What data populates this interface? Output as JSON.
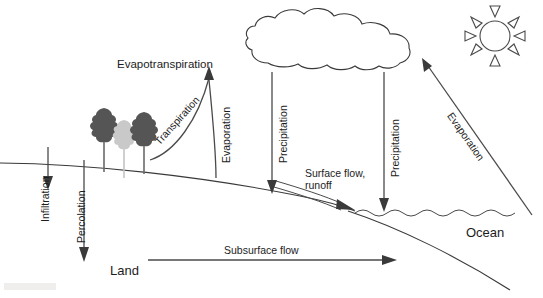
{
  "diagram": {
    "background_color": "#ffffff",
    "line_color": "#3a3a3a",
    "text_color": "#1c1c1c"
  },
  "labels": {
    "evapotranspiration": "Evapotranspiration",
    "transpiration": "Transpiration",
    "evaporation_land": "Evaporation",
    "precipitation_left": "Precipitation",
    "precipitation_right": "Precipitation",
    "evaporation_ocean": "Evaporation",
    "surface_flow_line1": "Surface flow,",
    "surface_flow_line2": "runoff",
    "infiltration": "Infiltration",
    "percolation": "Percolation",
    "subsurface_flow": "Subsurface flow",
    "land": "Land",
    "ocean": "Ocean"
  },
  "elements": {
    "cloud": "cloud-shape",
    "sun": "sun-shape",
    "trees": "tree-group",
    "ground": "ground-surface-line",
    "seabed": "seabed-line",
    "ocean_waves": "wavy-water-surface"
  },
  "flows": [
    {
      "name": "evapotranspiration",
      "direction": "up",
      "from": "land-surface",
      "to": "atmosphere"
    },
    {
      "name": "transpiration",
      "direction": "up",
      "from": "trees",
      "to": "atmosphere"
    },
    {
      "name": "evaporation-land",
      "direction": "up",
      "from": "land-surface",
      "to": "atmosphere"
    },
    {
      "name": "precipitation-left",
      "direction": "down",
      "from": "cloud",
      "to": "land"
    },
    {
      "name": "precipitation-right",
      "direction": "down",
      "from": "cloud",
      "to": "ocean"
    },
    {
      "name": "evaporation-ocean",
      "direction": "up",
      "from": "ocean",
      "to": "cloud"
    },
    {
      "name": "surface-flow-runoff",
      "direction": "downslope",
      "from": "land",
      "to": "ocean"
    },
    {
      "name": "infiltration",
      "direction": "down",
      "from": "surface",
      "to": "subsurface"
    },
    {
      "name": "percolation",
      "direction": "down",
      "from": "surface",
      "to": "deep-subsurface"
    },
    {
      "name": "subsurface-flow",
      "direction": "right",
      "from": "land",
      "to": "ocean"
    }
  ]
}
